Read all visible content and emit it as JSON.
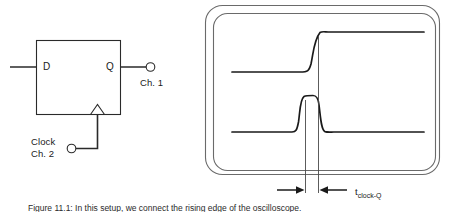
{
  "figure": {
    "caption": "Figure 11.1: In this setup, we connect the rising edge of the oscilloscope.",
    "background_color": "#ffffff",
    "line_color": "#1a1a1a",
    "bezel_color": "#555555"
  },
  "circuit": {
    "title": "D flip-flop under test",
    "block_name": "d-flip-flop",
    "ports": {
      "d_input_label": "D",
      "q_output_label": "Q"
    },
    "probes": [
      {
        "name": "q-probe",
        "label": "Ch. 1"
      },
      {
        "name": "clock-probe",
        "label_line1": "Clock",
        "label_line2": "Ch. 2"
      }
    ],
    "clock_edge_symbol": "rising-edge-triangle"
  },
  "scope": {
    "name": "oscilloscope-display",
    "bezel_style": "double-rounded-rect",
    "traces": [
      {
        "name": "q-output-trace",
        "channel": "Ch. 1",
        "signal": "Q",
        "shape": "rising-edge",
        "low_level_y": 72,
        "high_level_y": 32,
        "edge_x": 315
      },
      {
        "name": "clock-trace",
        "channel": "Ch. 2",
        "signal": "Clock",
        "shape": "narrow-pulse",
        "baseline_y": 132,
        "peak_y": 96,
        "pulse_start_x": 297,
        "pulse_end_x": 318
      }
    ],
    "cursors": [
      {
        "name": "cursor-clock-edge",
        "x": 305
      },
      {
        "name": "cursor-q-edge",
        "x": 318
      }
    ]
  },
  "measurement": {
    "name": "clock-to-q-delay",
    "symbol_base": "t",
    "symbol_subscript": "clock-Q",
    "annotation_style": "double-arrow-dimension"
  }
}
